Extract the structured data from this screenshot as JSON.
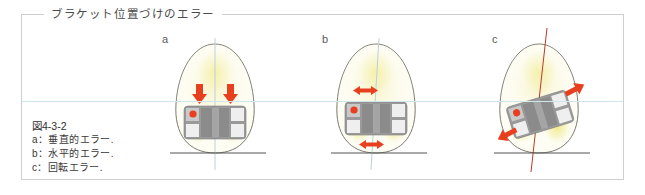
{
  "figure": {
    "title": "ブラケット位置づけのエラー",
    "caption": {
      "number": "図4-3-2",
      "lines": [
        "a：垂直的エラー.",
        "b：水平的エラー.",
        "c：回転エラー."
      ]
    }
  },
  "panels": [
    {
      "letter": "a",
      "error_type": "vertical",
      "arrow_icon": "arrow-down-icon",
      "arrow_count": 2,
      "arrow_direction": "down",
      "axis_color": "#b9c9cf",
      "axis_tilted": false,
      "bracket_rotation_deg": 0
    },
    {
      "letter": "b",
      "error_type": "horizontal",
      "arrow_icon": "arrow-left-right-icon",
      "arrow_count": 2,
      "arrow_direction": "horizontal",
      "axis_color": "#b9c9cf",
      "axis_tilted": false,
      "bracket_rotation_deg": 0
    },
    {
      "letter": "c",
      "error_type": "rotation",
      "arrow_icon": "arrow-diagonal-icon",
      "arrow_count": 2,
      "arrow_direction": "diagonal",
      "axis_color": "#c0392b",
      "axis_tilted": true,
      "bracket_rotation_deg": -17
    }
  ],
  "colors": {
    "tooth_fill": "#fdfdf2",
    "tooth_glow": "#f2ec9a",
    "tooth_outline": "#6b6b5e",
    "bracket_body": "#8e8e8e",
    "bracket_light": "#efefef",
    "bracket_mid": "#b6b6b6",
    "marker_dot": "#e8401f",
    "arrow_red": "#e8401f",
    "guide_cyan": "#cfe6ea",
    "guide_red": "#c0392b",
    "baseline": "#555555",
    "frame_border": "#cfcfcf",
    "title_text": "#4b4b4b",
    "caption_text": "#3a3a3a"
  }
}
